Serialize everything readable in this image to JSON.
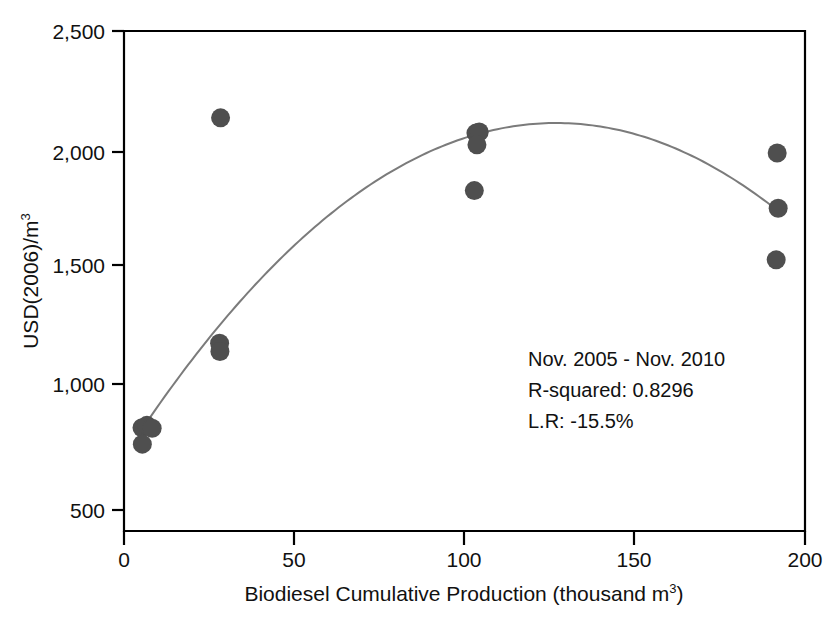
{
  "chart_data": {
    "type": "scatter",
    "title": "",
    "xlabel": "Biodiesel Cumulative Production (thousand m3)",
    "xlabel_main": "Biodiesel Cumulative Production (thousand m",
    "xlabel_sup": "3",
    "xlabel_tail": ")",
    "ylabel": "USD(2006)/m3",
    "ylabel_main": "USD(2006)/m",
    "ylabel_sup": "3",
    "xlim": [
      -4,
      204
    ],
    "ylim": [
      430,
      2560
    ],
    "xticks": [
      0,
      50,
      100,
      150,
      200
    ],
    "xtick_labels": [
      "0",
      "50",
      "100",
      "150",
      "200"
    ],
    "yticks": [
      500,
      1000,
      1500,
      2000,
      2500
    ],
    "ytick_labels": [
      "500",
      "1,000",
      "1,500",
      "2,000",
      "2,500"
    ],
    "grid": false,
    "legend": "none",
    "point_color": "#4f4f4f",
    "curve_color": "#7b7b7b",
    "axis_color": "#000000",
    "points": [
      {
        "x": 1.5,
        "y": 870
      },
      {
        "x": 1.6,
        "y": 800
      },
      {
        "x": 3.0,
        "y": 880
      },
      {
        "x": 4.6,
        "y": 868
      },
      {
        "x": 25.5,
        "y": 2190
      },
      {
        "x": 25.2,
        "y": 1230
      },
      {
        "x": 25.3,
        "y": 1195
      },
      {
        "x": 103.5,
        "y": 2125
      },
      {
        "x": 104.5,
        "y": 2130
      },
      {
        "x": 103.8,
        "y": 2075
      },
      {
        "x": 103.0,
        "y": 1880
      },
      {
        "x": 195.5,
        "y": 2040
      },
      {
        "x": 195.8,
        "y": 1805
      },
      {
        "x": 195.2,
        "y": 1585
      }
    ],
    "fit_curve": {
      "kind": "quadratic",
      "description": "quadratic regression fit peaking near x=128",
      "vertex_x": 128,
      "vertex_y": 2168,
      "x_start": 2.3,
      "y_start": 880,
      "x_end": 196,
      "y_end": 1805
    },
    "annotations": [
      "Nov. 2005 - Nov. 2010",
      "R-squared: 0.8296",
      "L.R: -15.5%"
    ]
  }
}
